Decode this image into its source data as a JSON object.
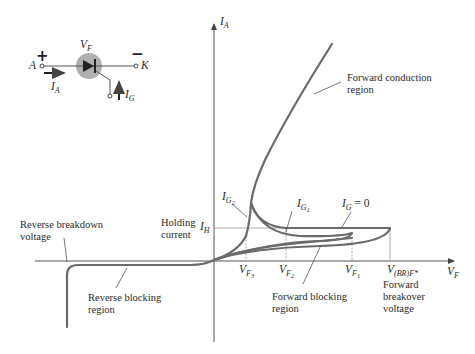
{
  "diagram": {
    "axes": {
      "y_label": "I",
      "y_label_sub": "A",
      "x_label": "V",
      "x_label_sub": "F",
      "holding_level_label": "I",
      "holding_level_sub": "H"
    },
    "symbol": {
      "voltage_label": "V",
      "voltage_sub": "F",
      "plus": "+",
      "minus": "−",
      "anode": "A",
      "cathode": "K",
      "anode_current": "I",
      "anode_current_sub": "A",
      "gate_current": "I",
      "gate_current_sub": "G"
    },
    "voltage_ticks": [
      {
        "base": "V",
        "sub": "F",
        "subsub": "3"
      },
      {
        "base": "V",
        "sub": "F",
        "subsub": "2"
      },
      {
        "base": "V",
        "sub": "F",
        "subsub": "1"
      },
      {
        "base": "V",
        "sub": "(BR)F*",
        "subsub": ""
      }
    ],
    "gate_curves": [
      {
        "base": "I",
        "sub": "G",
        "subsub": "2",
        "suffix": ""
      },
      {
        "base": "I",
        "sub": "G",
        "subsub": "1",
        "suffix": ""
      },
      {
        "base": "I",
        "sub": "G",
        "subsub": "",
        "suffix": " = 0"
      }
    ],
    "annotations": {
      "forward_conduction_1": "Forward conduction",
      "forward_conduction_2": "region",
      "holding_current_1": "Holding",
      "holding_current_2": "current",
      "reverse_breakdown_1": "Reverse breakdown",
      "reverse_breakdown_2": "voltage",
      "reverse_blocking_1": "Reverse blocking",
      "reverse_blocking_2": "region",
      "forward_blocking_1": "Forward blocking",
      "forward_blocking_2": "region",
      "forward_breakover_1": "Forward",
      "forward_breakover_2": "breakover",
      "forward_breakover_3": "voltage"
    },
    "colors": {
      "curve": "#6a6a6a",
      "axis": "#555555",
      "guide": "#9a9a9a",
      "symbol_circle": "#b0b0b0"
    }
  }
}
